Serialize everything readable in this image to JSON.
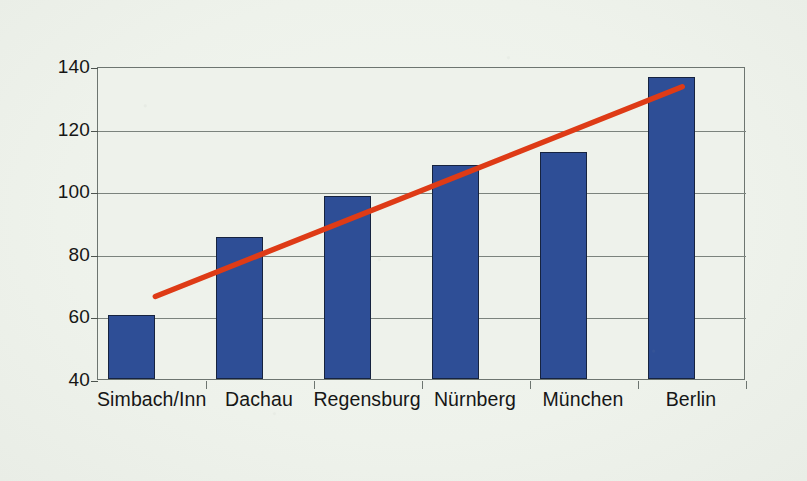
{
  "chart_data": {
    "type": "bar",
    "title": "",
    "subtitle": "",
    "xlabel": "",
    "ylabel": "",
    "categories": [
      "Simbach/Inn",
      "Dachau",
      "Regensburg",
      "Nürnberg",
      "München",
      "Berlin"
    ],
    "values": [
      60.5,
      85.5,
      98.5,
      108.5,
      112.5,
      136.5
    ],
    "series": [
      {
        "name": "Werte",
        "type": "bar",
        "values": [
          60.5,
          85.5,
          98.5,
          108.5,
          112.5,
          136.5
        ]
      },
      {
        "name": "Trendlinie",
        "type": "line",
        "endpoints": [
          {
            "x": 0.22,
            "y": 67
          },
          {
            "x": 5.1,
            "y": 134
          }
        ]
      }
    ],
    "ylim": [
      40,
      140
    ],
    "yticks": [
      40,
      60,
      80,
      100,
      120,
      140
    ],
    "ytick_labels": [
      "40",
      "60",
      "80",
      "100",
      "120",
      "140"
    ],
    "grid": "horizontal",
    "legend": "none",
    "colors": {
      "bar_fill": "#2E4E96",
      "bar_border": "#16233F",
      "trendline": "#DE3B16",
      "plot_background": "#EEF2EB",
      "axis": "#6D7570",
      "gridline": "#7B837D",
      "text": "#161616"
    }
  }
}
